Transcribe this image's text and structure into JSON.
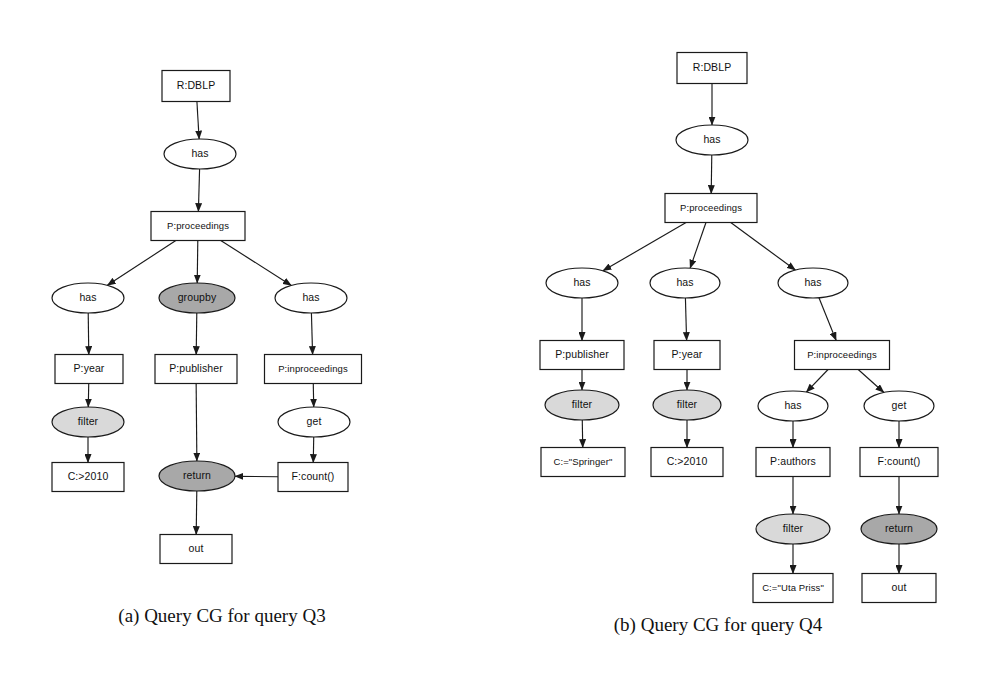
{
  "page": {
    "background_color": "#ffffff",
    "width": 989,
    "height": 676,
    "kind": "scanned-paper-figure"
  },
  "style_colors": {
    "stroke": "#1a1a1a",
    "box_fill": "#ffffff",
    "ellipse_fill": "#ffffff",
    "shaded_light_fill": "#d9d9d9",
    "shaded_dark_fill": "#a8a8a8",
    "text": "#111111"
  },
  "figures": [
    {
      "id": "figure-a",
      "caption": "(a) Query CG for query Q3",
      "caption_x": 222,
      "caption_y": 622,
      "nodes": [
        {
          "id": "a-root",
          "label": "R:DBLP",
          "shape": "box",
          "fill": "none",
          "cx": 196,
          "cy": 86,
          "w": 68,
          "h": 31
        },
        {
          "id": "a-has1",
          "label": "has",
          "shape": "ellipse",
          "fill": "none",
          "cx": 200,
          "cy": 154,
          "w": 72,
          "h": 30
        },
        {
          "id": "a-proc",
          "label": "P:proceedings",
          "shape": "box",
          "fill": "none",
          "cx": 198,
          "cy": 226,
          "w": 94,
          "h": 29
        },
        {
          "id": "a-has2",
          "label": "has",
          "shape": "ellipse",
          "fill": "none",
          "cx": 88,
          "cy": 298,
          "w": 72,
          "h": 30
        },
        {
          "id": "a-groupby",
          "label": "groupby",
          "shape": "ellipse",
          "fill": "dark",
          "cx": 197,
          "cy": 298,
          "w": 76,
          "h": 30
        },
        {
          "id": "a-has3",
          "label": "has",
          "shape": "ellipse",
          "fill": "none",
          "cx": 311,
          "cy": 298,
          "w": 72,
          "h": 30
        },
        {
          "id": "a-year",
          "label": "P:year",
          "shape": "box",
          "fill": "none",
          "cx": 89,
          "cy": 369,
          "w": 68,
          "h": 29
        },
        {
          "id": "a-publisher",
          "label": "P:publisher",
          "shape": "box",
          "fill": "none",
          "cx": 196,
          "cy": 369,
          "w": 82,
          "h": 29
        },
        {
          "id": "a-inproc",
          "label": "P:inproceedings",
          "shape": "box",
          "fill": "none",
          "cx": 313,
          "cy": 369,
          "w": 97,
          "h": 29
        },
        {
          "id": "a-filter",
          "label": "filter",
          "shape": "ellipse",
          "fill": "light",
          "cx": 88,
          "cy": 422,
          "w": 72,
          "h": 30
        },
        {
          "id": "a-get",
          "label": "get",
          "shape": "ellipse",
          "fill": "none",
          "cx": 314,
          "cy": 422,
          "w": 72,
          "h": 30
        },
        {
          "id": "a-c2010",
          "label": "C:>2010",
          "shape": "box",
          "fill": "none",
          "cx": 88,
          "cy": 477,
          "w": 72,
          "h": 29
        },
        {
          "id": "a-return",
          "label": "return",
          "shape": "ellipse",
          "fill": "dark",
          "cx": 197,
          "cy": 476,
          "w": 76,
          "h": 30
        },
        {
          "id": "a-count",
          "label": "F:count()",
          "shape": "box",
          "fill": "none",
          "cx": 313,
          "cy": 477,
          "w": 70,
          "h": 29
        },
        {
          "id": "a-out",
          "label": "out",
          "shape": "box",
          "fill": "none",
          "cx": 196,
          "cy": 549,
          "w": 72,
          "h": 29
        }
      ],
      "edges": [
        {
          "from": "a-root",
          "to": "a-has1"
        },
        {
          "from": "a-has1",
          "to": "a-proc"
        },
        {
          "from": "a-proc",
          "to": "a-has2"
        },
        {
          "from": "a-proc",
          "to": "a-groupby"
        },
        {
          "from": "a-proc",
          "to": "a-has3"
        },
        {
          "from": "a-has2",
          "to": "a-year"
        },
        {
          "from": "a-groupby",
          "to": "a-publisher"
        },
        {
          "from": "a-has3",
          "to": "a-inproc"
        },
        {
          "from": "a-year",
          "to": "a-filter"
        },
        {
          "from": "a-inproc",
          "to": "a-get"
        },
        {
          "from": "a-filter",
          "to": "a-c2010"
        },
        {
          "from": "a-publisher",
          "to": "a-return"
        },
        {
          "from": "a-get",
          "to": "a-count"
        },
        {
          "from": "a-count",
          "to": "a-return"
        },
        {
          "from": "a-return",
          "to": "a-out"
        }
      ]
    },
    {
      "id": "figure-b",
      "caption": "(b) Query CG for query Q4",
      "caption_x": 718,
      "caption_y": 631,
      "nodes": [
        {
          "id": "b-root",
          "label": "R:DBLP",
          "shape": "box",
          "fill": "none",
          "cx": 712,
          "cy": 68,
          "w": 70,
          "h": 31
        },
        {
          "id": "b-has1",
          "label": "has",
          "shape": "ellipse",
          "fill": "none",
          "cx": 712,
          "cy": 140,
          "w": 72,
          "h": 30
        },
        {
          "id": "b-proc",
          "label": "P:proceedings",
          "shape": "box",
          "fill": "none",
          "cx": 711,
          "cy": 208,
          "w": 92,
          "h": 29
        },
        {
          "id": "b-has2",
          "label": "has",
          "shape": "ellipse",
          "fill": "none",
          "cx": 582,
          "cy": 283,
          "w": 72,
          "h": 30
        },
        {
          "id": "b-has3",
          "label": "has",
          "shape": "ellipse",
          "fill": "none",
          "cx": 685,
          "cy": 283,
          "w": 70,
          "h": 30
        },
        {
          "id": "b-has4",
          "label": "has",
          "shape": "ellipse",
          "fill": "none",
          "cx": 813,
          "cy": 283,
          "w": 70,
          "h": 30
        },
        {
          "id": "b-publisher",
          "label": "P:publisher",
          "shape": "box",
          "fill": "none",
          "cx": 582,
          "cy": 355,
          "w": 84,
          "h": 29
        },
        {
          "id": "b-year",
          "label": "P:year",
          "shape": "box",
          "fill": "none",
          "cx": 687,
          "cy": 355,
          "w": 66,
          "h": 29
        },
        {
          "id": "b-inproc",
          "label": "P:inproceedings",
          "shape": "box",
          "fill": "none",
          "cx": 842,
          "cy": 355,
          "w": 95,
          "h": 29
        },
        {
          "id": "b-filter1",
          "label": "filter",
          "shape": "ellipse",
          "fill": "light",
          "cx": 582,
          "cy": 405,
          "w": 74,
          "h": 30
        },
        {
          "id": "b-filter2",
          "label": "filter",
          "shape": "ellipse",
          "fill": "light",
          "cx": 687,
          "cy": 405,
          "w": 68,
          "h": 30
        },
        {
          "id": "b-has5",
          "label": "has",
          "shape": "ellipse",
          "fill": "none",
          "cx": 793,
          "cy": 406,
          "w": 70,
          "h": 30
        },
        {
          "id": "b-get",
          "label": "get",
          "shape": "ellipse",
          "fill": "none",
          "cx": 899,
          "cy": 406,
          "w": 70,
          "h": 30
        },
        {
          "id": "b-springer",
          "label": "C:=\"Springer\"",
          "shape": "box",
          "fill": "none",
          "cx": 583,
          "cy": 462,
          "w": 84,
          "h": 29
        },
        {
          "id": "b-c2010",
          "label": "C:>2010",
          "shape": "box",
          "fill": "none",
          "cx": 687,
          "cy": 462,
          "w": 72,
          "h": 29
        },
        {
          "id": "b-authors",
          "label": "P:authors",
          "shape": "box",
          "fill": "none",
          "cx": 793,
          "cy": 462,
          "w": 74,
          "h": 29
        },
        {
          "id": "b-count",
          "label": "F:count()",
          "shape": "box",
          "fill": "none",
          "cx": 899,
          "cy": 462,
          "w": 78,
          "h": 29
        },
        {
          "id": "b-filter3",
          "label": "filter",
          "shape": "ellipse",
          "fill": "light",
          "cx": 793,
          "cy": 529,
          "w": 74,
          "h": 30
        },
        {
          "id": "b-return",
          "label": "return",
          "shape": "ellipse",
          "fill": "dark",
          "cx": 899,
          "cy": 529,
          "w": 76,
          "h": 30
        },
        {
          "id": "b-uta",
          "label": "C:=\"Uta Priss\"",
          "shape": "box",
          "fill": "none",
          "cx": 793,
          "cy": 588,
          "w": 80,
          "h": 29
        },
        {
          "id": "b-out",
          "label": "out",
          "shape": "box",
          "fill": "none",
          "cx": 899,
          "cy": 588,
          "w": 74,
          "h": 29
        }
      ],
      "edges": [
        {
          "from": "b-root",
          "to": "b-has1"
        },
        {
          "from": "b-has1",
          "to": "b-proc"
        },
        {
          "from": "b-proc",
          "to": "b-has2"
        },
        {
          "from": "b-proc",
          "to": "b-has3"
        },
        {
          "from": "b-proc",
          "to": "b-has4"
        },
        {
          "from": "b-has2",
          "to": "b-publisher"
        },
        {
          "from": "b-has3",
          "to": "b-year"
        },
        {
          "from": "b-has4",
          "to": "b-inproc"
        },
        {
          "from": "b-publisher",
          "to": "b-filter1"
        },
        {
          "from": "b-year",
          "to": "b-filter2"
        },
        {
          "from": "b-inproc",
          "to": "b-has5"
        },
        {
          "from": "b-inproc",
          "to": "b-get"
        },
        {
          "from": "b-filter1",
          "to": "b-springer"
        },
        {
          "from": "b-filter2",
          "to": "b-c2010"
        },
        {
          "from": "b-has5",
          "to": "b-authors"
        },
        {
          "from": "b-get",
          "to": "b-count"
        },
        {
          "from": "b-authors",
          "to": "b-filter3"
        },
        {
          "from": "b-count",
          "to": "b-return"
        },
        {
          "from": "b-filter3",
          "to": "b-uta"
        },
        {
          "from": "b-return",
          "to": "b-out"
        }
      ]
    }
  ]
}
